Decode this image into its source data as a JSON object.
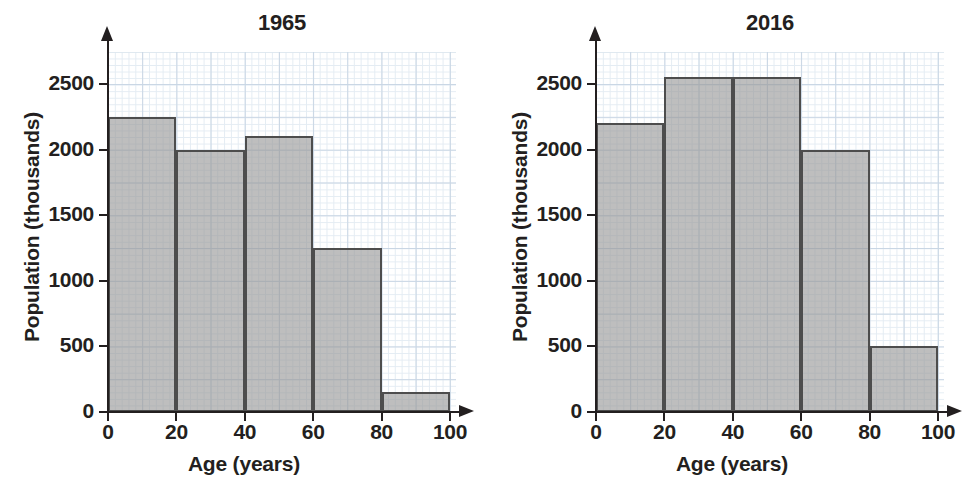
{
  "figure": {
    "panels": [
      {
        "title": "1965",
        "xlabel": "Age (years)",
        "ylabel": "Population (thousands)",
        "xticks": [
          "0",
          "20",
          "40",
          "60",
          "80",
          "100"
        ],
        "yticks": [
          "0",
          "500",
          "1000",
          "1500",
          "2000",
          "2500"
        ]
      },
      {
        "title": "2016",
        "xlabel": "Age (years)",
        "ylabel": "Population (thousands)",
        "xticks": [
          "0",
          "20",
          "40",
          "60",
          "80",
          "100"
        ],
        "yticks": [
          "0",
          "500",
          "1000",
          "1500",
          "2000",
          "2500"
        ]
      }
    ],
    "colors": {
      "bar_fill": "#969696",
      "bar_edge": "#4d4d4d",
      "grid_major": "#c9d6e4",
      "grid_minor": "#e4ecf3",
      "axis": "#231f20",
      "text": "#231f20",
      "background": "#ffffff"
    }
  },
  "chart_data": [
    {
      "type": "bar",
      "title": "1965",
      "xlabel": "Age (years)",
      "ylabel": "Population (thousands)",
      "bin_edges": [
        0,
        20,
        40,
        60,
        80,
        100
      ],
      "categories": [
        "0-20",
        "20-40",
        "40-60",
        "60-80",
        "80-100"
      ],
      "values": [
        2250,
        2000,
        2100,
        1250,
        150
      ],
      "xlim": [
        0,
        100
      ],
      "ylim": [
        0,
        2750
      ],
      "xticks": [
        0,
        20,
        40,
        60,
        80,
        100
      ],
      "yticks": [
        0,
        500,
        1000,
        1500,
        2000,
        2500
      ],
      "grid": true,
      "legend": null
    },
    {
      "type": "bar",
      "title": "2016",
      "xlabel": "Age (years)",
      "ylabel": "Population (thousands)",
      "bin_edges": [
        0,
        20,
        40,
        60,
        80,
        100
      ],
      "categories": [
        "0-20",
        "20-40",
        "40-60",
        "60-80",
        "80-100"
      ],
      "values": [
        2200,
        2550,
        2550,
        2000,
        500
      ],
      "xlim": [
        0,
        100
      ],
      "ylim": [
        0,
        2750
      ],
      "xticks": [
        0,
        20,
        40,
        60,
        80,
        100
      ],
      "yticks": [
        0,
        500,
        1000,
        1500,
        2000,
        2500
      ],
      "grid": true,
      "legend": null
    }
  ]
}
